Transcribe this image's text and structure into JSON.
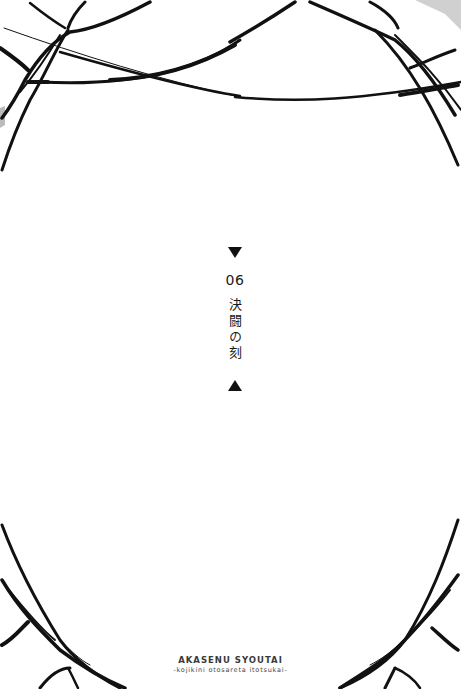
{
  "page": {
    "background_color": "#ffffff",
    "ink_color": "#111111"
  },
  "chapter": {
    "marker_top": "▼",
    "number": "06",
    "title": "決闘の刻",
    "marker_bottom": "▲"
  },
  "footer": {
    "series_title": "AKASENU SYOUTAI",
    "series_subtitle": "-kojikini otosareta itotsukai-"
  },
  "decoration": {
    "top_left": "thread-web-icon",
    "top_right": "thread-web-icon",
    "bottom_left": "thread-web-icon",
    "bottom_right": "thread-web-icon"
  }
}
